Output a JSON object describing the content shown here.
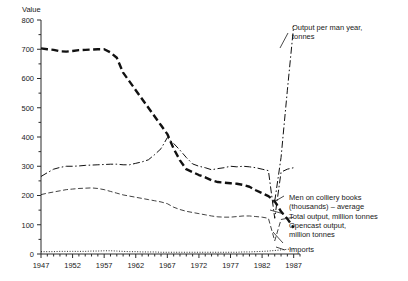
{
  "chart_data": {
    "type": "line",
    "title": "",
    "xlabel": "",
    "ylabel": "Value",
    "xlim": [
      1947,
      1988
    ],
    "ylim": [
      0,
      800
    ],
    "grid": false,
    "legend_position": "inline-right-annotations",
    "x_ticks_major": [
      1947,
      1952,
      1957,
      1962,
      1967,
      1972,
      1977,
      1982,
      1987
    ],
    "x_tick_labels": [
      "1947",
      "1952",
      "1957",
      "1962",
      "1967",
      "1972",
      "1977",
      "1982",
      "1987"
    ],
    "x_tick_interval_minor": 1,
    "y_ticks_major": [
      0,
      100,
      200,
      300,
      400,
      500,
      600,
      700,
      800
    ],
    "y_tick_labels": [
      "0",
      "100",
      "200",
      "300",
      "400",
      "500",
      "600",
      "700",
      "800"
    ],
    "y_tick_interval_minor": 50,
    "x": [
      1947,
      1948,
      1949,
      1950,
      1951,
      1952,
      1953,
      1954,
      1955,
      1956,
      1957,
      1958,
      1959,
      1960,
      1961,
      1962,
      1963,
      1964,
      1965,
      1966,
      1967,
      1968,
      1969,
      1970,
      1971,
      1972,
      1973,
      1974,
      1975,
      1976,
      1977,
      1978,
      1979,
      1980,
      1981,
      1982,
      1983,
      1984,
      1985,
      1986,
      1987
    ],
    "series": [
      {
        "name": "Men on colliery books (thousands) – average",
        "style": "heavy-dash",
        "values": [
          703,
          700,
          698,
          693,
          692,
          694,
          697,
          698,
          699,
          700,
          700,
          689,
          671,
          620,
          590,
          560,
          530,
          500,
          470,
          440,
          410,
          360,
          320,
          290,
          280,
          270,
          262,
          252,
          246,
          244,
          242,
          240,
          236,
          230,
          218,
          208,
          198,
          180,
          145,
          120,
          90
        ]
      },
      {
        "name": "Total output, million tonnes",
        "style": "dash-dot",
        "values": [
          265,
          278,
          290,
          296,
          300,
          300,
          301,
          303,
          304,
          305,
          306,
          307,
          307,
          305,
          305,
          310,
          315,
          322,
          340,
          360,
          398,
          378,
          355,
          330,
          308,
          300,
          295,
          288,
          292,
          295,
          300,
          298,
          300,
          298,
          295,
          290,
          285,
          122,
          280,
          290,
          295
        ]
      },
      {
        "name": "Output per man year, tonnes",
        "style": "dash-dot",
        "values": [
          null,
          null,
          null,
          null,
          null,
          null,
          null,
          null,
          null,
          null,
          null,
          null,
          null,
          null,
          null,
          null,
          null,
          null,
          null,
          null,
          null,
          null,
          null,
          null,
          null,
          null,
          null,
          null,
          null,
          null,
          null,
          null,
          null,
          null,
          null,
          null,
          null,
          180,
          330,
          560,
          780
        ]
      },
      {
        "name": "Opencast output, million tonnes",
        "style": "thin-dash",
        "values": [
          203,
          208,
          212,
          216,
          220,
          222,
          224,
          225,
          226,
          224,
          220,
          214,
          208,
          202,
          198,
          194,
          190,
          186,
          182,
          178,
          172,
          160,
          152,
          146,
          142,
          138,
          134,
          130,
          127,
          126,
          126,
          128,
          130,
          130,
          128,
          126,
          122,
          45,
          118,
          122,
          125
        ]
      },
      {
        "name": "Imports",
        "style": "dotted",
        "values": [
          8,
          8,
          8,
          9,
          9,
          9,
          9,
          9,
          10,
          10,
          11,
          11,
          10,
          9,
          8,
          8,
          7,
          7,
          7,
          6,
          6,
          6,
          6,
          6,
          6,
          6,
          6,
          6,
          6,
          6,
          6,
          6,
          7,
          7,
          8,
          9,
          10,
          12,
          14,
          16,
          18
        ]
      }
    ],
    "annotations": [
      {
        "id": "ann-output-per-man",
        "text_lines": [
          "Output per man year,",
          "tonnes"
        ]
      },
      {
        "id": "ann-men-colliery",
        "text_lines": [
          "Men on colliery books",
          "(thousands) – average"
        ]
      },
      {
        "id": "ann-total-output",
        "text_lines": [
          "Total output, million tonnes"
        ]
      },
      {
        "id": "ann-opencast",
        "text_lines": [
          "Opencast output,",
          "million tonnes"
        ]
      },
      {
        "id": "ann-imports",
        "text_lines": [
          "Imports"
        ]
      }
    ]
  },
  "axes": {
    "y_axis_caption": "Value",
    "y_labels": [
      "800",
      "700",
      "600",
      "500",
      "400",
      "300",
      "200",
      "100",
      "0"
    ],
    "x_labels": [
      "1947",
      "1952",
      "1957",
      "1962",
      "1967",
      "1972",
      "1977",
      "1982",
      "1987"
    ]
  },
  "annotations": {
    "output_per_man_line1": "Output per man year,",
    "output_per_man_line2": "tonnes",
    "men_colliery_line1": "Men on colliery books",
    "men_colliery_line2": "(thousands) – average",
    "total_output_line1": "Total output, million tonnes",
    "opencast_line1": "Opencast output,",
    "opencast_line2": "million tonnes",
    "imports_line1": "Imports"
  }
}
